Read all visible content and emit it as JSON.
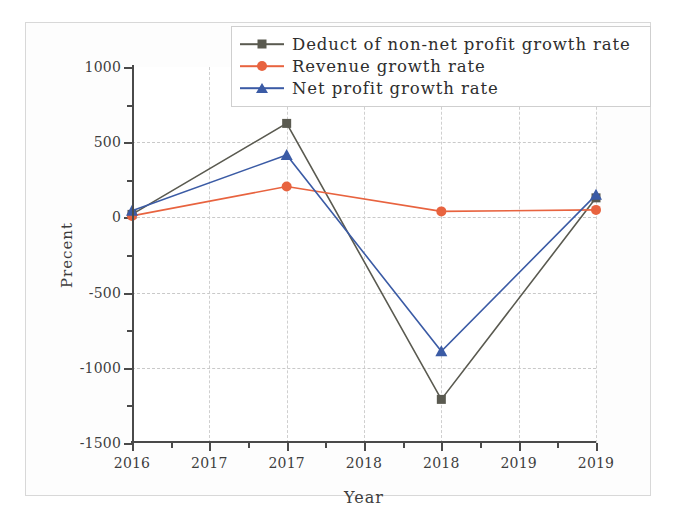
{
  "chart_data": {
    "type": "line",
    "title": "",
    "xlabel": "Year",
    "ylabel": "Precent",
    "xlim": [
      2016,
      2019
    ],
    "ylim": [
      -1500,
      1000
    ],
    "grid": true,
    "legend_position": "top-right",
    "x": [
      2016,
      2017,
      2018,
      2019
    ],
    "x_tick_values": [
      2016,
      2016.5,
      2017,
      2017.5,
      2018,
      2018.5,
      2019
    ],
    "x_tick_labels": [
      "2016",
      "2017",
      "2017",
      "2018",
      "2018",
      "2019",
      "2019"
    ],
    "y_tick_values": [
      1000,
      500,
      0,
      -500,
      -1000,
      -1500
    ],
    "y_tick_labels": [
      "1000",
      "500",
      "0",
      "-500",
      "-1000",
      "-1500"
    ],
    "y_minor_ticks": [
      750,
      250,
      -250,
      -750,
      -1250
    ],
    "series": [
      {
        "name": "Deduct of non-net profit growth rate",
        "color": "#5a5a50",
        "marker": "square",
        "values": [
          20,
          625,
          -1210,
          130
        ]
      },
      {
        "name": "Revenue growth rate",
        "color": "#e8633f",
        "marker": "circle",
        "values": [
          10,
          205,
          40,
          50
        ]
      },
      {
        "name": "Net profit growth rate",
        "color": "#3b5ba5",
        "marker": "triangle",
        "values": [
          45,
          415,
          -890,
          150
        ]
      }
    ]
  },
  "legend": {
    "items": [
      {
        "label": "Deduct of non-net profit growth rate"
      },
      {
        "label": "Revenue growth rate"
      },
      {
        "label": "Net profit growth rate"
      }
    ]
  },
  "axes": {
    "x_title": "Year",
    "y_title": "Precent"
  }
}
